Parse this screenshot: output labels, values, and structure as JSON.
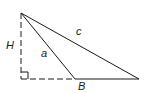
{
  "diagram": {
    "type": "triangle-with-height",
    "labels": {
      "height": "H",
      "side_a": "a",
      "side_c": "c",
      "base_point": "B"
    },
    "colors": {
      "stroke": "#1a1a1a",
      "background": "#ffffff"
    },
    "points": {
      "apex": [
        21,
        13
      ],
      "foot": [
        21,
        79
      ],
      "a_end": [
        75,
        79
      ],
      "c_end": [
        139,
        79
      ]
    }
  }
}
